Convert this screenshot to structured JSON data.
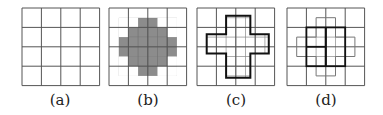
{
  "figure": {
    "grid_size": 4,
    "cell_px": 19.4,
    "colors": {
      "grid_line": "#555555",
      "fine_line": "#8a8a8a",
      "bold_line": "#111111",
      "fill": "#8c8c8c",
      "background": "#ffffff"
    },
    "panels": [
      {
        "id": "a",
        "label": "(a)",
        "origin": [
          22,
          8
        ],
        "label_x": 60,
        "description": "plain 4x4 grid"
      },
      {
        "id": "b",
        "label": "(b)",
        "origin": [
          109,
          8
        ],
        "label_x": 148,
        "description": "4x4 grid with gray rounded-cross region made of half cells",
        "filled_half_cells_rows": [
          {
            "row": 1,
            "from": 3,
            "to": 5
          },
          {
            "row": 2,
            "from": 2,
            "to": 6
          },
          {
            "row": 3,
            "from": 1,
            "to": 7
          },
          {
            "row": 4,
            "from": 1,
            "to": 7
          },
          {
            "row": 5,
            "from": 2,
            "to": 6
          },
          {
            "row": 6,
            "from": 3,
            "to": 5
          }
        ]
      },
      {
        "id": "c",
        "label": "(c)",
        "origin": [
          197,
          8
        ],
        "label_x": 236,
        "description": "4x4 grid with bold cross outline and fine subdivisions inside",
        "cross": {
          "vertical": [
            1.5,
            0.4,
            2.75,
            3.6
          ],
          "horizontal": [
            0.5,
            1.35,
            3.7,
            2.35
          ]
        }
      },
      {
        "id": "d",
        "label": "(d)",
        "origin": [
          287,
          8
        ],
        "label_x": 326,
        "description": "4x4 grid with light cross outline and bold 2x2 block of cells",
        "cross": {
          "vertical": [
            1.5,
            0.5,
            2.5,
            3.5
          ],
          "horizontal": [
            0.5,
            1.5,
            3.5,
            2.5
          ]
        },
        "bold_block": [
          1,
          1,
          3,
          3
        ]
      }
    ]
  }
}
